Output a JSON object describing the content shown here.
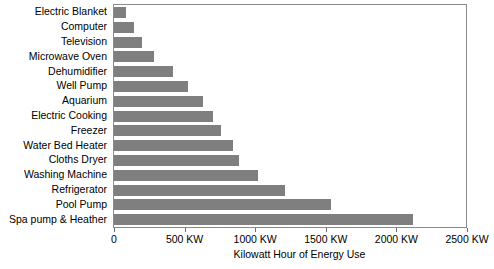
{
  "chart_data": {
    "type": "bar",
    "orientation": "horizontal",
    "title": "",
    "xlabel": "Kilowatt Hour of Energy Use",
    "ylabel": "",
    "xlim": [
      0,
      2500
    ],
    "grid": false,
    "legend": null,
    "bar_color": "#7f7f7f",
    "frame_color": "#8a8a8a",
    "xtick_labels": [
      "0",
      "500 KW",
      "1000 KW",
      "1500 KW",
      "2000 KW",
      "2500 KW"
    ],
    "xtick_values": [
      0,
      500,
      1000,
      1500,
      2000,
      2500
    ],
    "categories": [
      "Electric Blanket",
      "Computer",
      "Television",
      "Microwave Oven",
      "Dehumidifier",
      "Well Pump",
      "Aquarium",
      "Electric Cooking",
      "Freezer",
      "Water Bed Heater",
      "Cloths Dryer",
      "Washing Machine",
      "Refrigerator",
      "Pool Pump",
      "Spa pump & Heather"
    ],
    "values": [
      85,
      140,
      200,
      280,
      420,
      525,
      630,
      700,
      760,
      840,
      885,
      1020,
      1210,
      1535,
      2120
    ],
    "units": "KW"
  }
}
